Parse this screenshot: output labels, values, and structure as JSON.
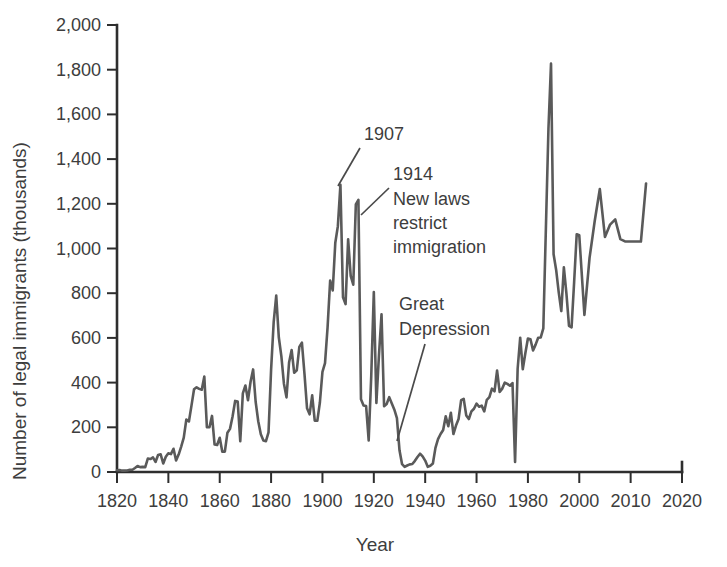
{
  "chart_data": {
    "type": "line",
    "title": "",
    "xlabel": "Year",
    "ylabel": "Number of legal immigrants (thousands)",
    "xlim": [
      1820,
      2020
    ],
    "ylim": [
      0,
      2000
    ],
    "grid": false,
    "legend": "none",
    "line_color": "#5a5a5a",
    "axis_color": "#2e2e2e",
    "x_tick_labels": [
      "1820",
      "1840",
      "1860",
      "1880",
      "1900",
      "1920",
      "1940",
      "1960",
      "1980",
      "2000",
      "2010",
      "2020"
    ],
    "y_tick_labels": [
      "0",
      "200",
      "400",
      "600",
      "800",
      "1,000",
      "1,200",
      "1,400",
      "1,600",
      "1,800",
      "2,000"
    ],
    "y_ticks": [
      0,
      200,
      400,
      600,
      800,
      1000,
      1200,
      1400,
      1600,
      1800,
      2000
    ],
    "annotations": [
      {
        "id": "peak-1907",
        "text": "1907",
        "lines": [
          "1907"
        ]
      },
      {
        "id": "laws-1914",
        "text": "1914 New laws restrict immigration",
        "lines": [
          "1914",
          "New laws",
          "restrict",
          "immigration"
        ]
      },
      {
        "id": "great-depression",
        "text": "Great Depression",
        "lines": [
          "Great",
          "Depression"
        ]
      }
    ],
    "x": [
      1820,
      1821,
      1822,
      1823,
      1824,
      1825,
      1826,
      1827,
      1828,
      1829,
      1830,
      1831,
      1832,
      1833,
      1834,
      1835,
      1836,
      1837,
      1838,
      1839,
      1840,
      1841,
      1842,
      1843,
      1844,
      1845,
      1846,
      1847,
      1848,
      1849,
      1850,
      1851,
      1852,
      1853,
      1854,
      1855,
      1856,
      1857,
      1858,
      1859,
      1860,
      1861,
      1862,
      1863,
      1864,
      1865,
      1866,
      1867,
      1868,
      1869,
      1870,
      1871,
      1872,
      1873,
      1874,
      1875,
      1876,
      1877,
      1878,
      1879,
      1880,
      1881,
      1882,
      1883,
      1884,
      1885,
      1886,
      1887,
      1888,
      1889,
      1890,
      1891,
      1892,
      1893,
      1894,
      1895,
      1896,
      1897,
      1898,
      1899,
      1900,
      1901,
      1902,
      1903,
      1904,
      1905,
      1906,
      1907,
      1908,
      1909,
      1910,
      1911,
      1912,
      1913,
      1914,
      1915,
      1916,
      1917,
      1918,
      1919,
      1920,
      1921,
      1922,
      1923,
      1924,
      1925,
      1926,
      1927,
      1928,
      1929,
      1930,
      1931,
      1932,
      1933,
      1934,
      1935,
      1936,
      1937,
      1938,
      1939,
      1940,
      1941,
      1942,
      1943,
      1944,
      1945,
      1946,
      1947,
      1948,
      1949,
      1950,
      1951,
      1952,
      1953,
      1954,
      1955,
      1956,
      1957,
      1958,
      1959,
      1960,
      1961,
      1962,
      1963,
      1964,
      1965,
      1966,
      1967,
      1968,
      1969,
      1970,
      1971,
      1972,
      1973,
      1974,
      1975,
      1976,
      1977,
      1978,
      1979,
      1980,
      1981,
      1982,
      1983,
      1984,
      1985,
      1986,
      1987,
      1988,
      1989,
      1990,
      1991,
      1992,
      1993,
      1994,
      1995,
      1996,
      1997,
      1998,
      1999,
      2000,
      2001,
      2002,
      2003,
      2004,
      2005,
      2006,
      2007,
      2008,
      2009,
      2010,
      2011,
      2012,
      2013
    ],
    "y": [
      8,
      9,
      6,
      6,
      7,
      10,
      10,
      18,
      27,
      22,
      23,
      22,
      60,
      58,
      65,
      45,
      76,
      79,
      38,
      68,
      84,
      80,
      104,
      52,
      78,
      114,
      154,
      235,
      226,
      297,
      370,
      379,
      372,
      368,
      427,
      200,
      200,
      251,
      123,
      121,
      153,
      91,
      91,
      176,
      193,
      248,
      318,
      315,
      138,
      352,
      387,
      321,
      404,
      459,
      313,
      227,
      169,
      141,
      138,
      177,
      457,
      669,
      789,
      603,
      518,
      395,
      334,
      490,
      546,
      444,
      455,
      560,
      579,
      439,
      285,
      258,
      343,
      230,
      229,
      311,
      448,
      487,
      648,
      857,
      812,
      1026,
      1100,
      1285,
      782,
      751,
      1041,
      878,
      838,
      1197,
      1218,
      326,
      298,
      295,
      141,
      430,
      805,
      309,
      522,
      706,
      294,
      304,
      335,
      307,
      279,
      241,
      97,
      35,
      23,
      29,
      34,
      36,
      50,
      67,
      82,
      70,
      51,
      23,
      28,
      38,
      108,
      147,
      170,
      188,
      249,
      205,
      265,
      170,
      208,
      237,
      321,
      327,
      253,
      237,
      271,
      283,
      306,
      292,
      297,
      271,
      323,
      335,
      373,
      361,
      454,
      358,
      373,
      400,
      394,
      386,
      398,
      45,
      462,
      601,
      460,
      531,
      597,
      594,
      544,
      570,
      601,
      602,
      643,
      1091,
      1536,
      1827,
      974,
      904,
      804,
      720,
      916,
      798,
      654,
      647,
      850,
      1064,
      1059,
      703,
      958,
      1122,
      1266,
      1052,
      1107,
      1130,
      1042,
      1031,
      1031,
      1031,
      1031,
      1291
    ]
  }
}
